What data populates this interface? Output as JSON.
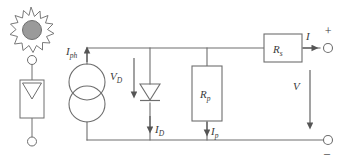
{
  "diagram": {
    "type": "electrical-schematic",
    "canvas": {
      "width": 349,
      "height": 168
    },
    "colors": {
      "wire": "#6e6e6e",
      "component_stroke": "#6e6e6e",
      "sun_fill": "#9a9a9a",
      "sun_stroke": "#6e6e6e",
      "label": "#3a3a3a",
      "background": "#ffffff"
    },
    "labels": {
      "photocurrent": "I",
      "photocurrent_sub": "ph",
      "diode_voltage": "V",
      "diode_voltage_sub": "D",
      "diode_current": "I",
      "diode_current_sub": "D",
      "shunt_resistor": "R",
      "shunt_resistor_sub": "p",
      "shunt_current": "I",
      "shunt_current_sub": "p",
      "series_resistor": "R",
      "series_resistor_sub": "s",
      "output_current": "I",
      "output_voltage": "V",
      "plus_terminal": "+",
      "minus_terminal": "–"
    },
    "components": [
      {
        "name": "sun-source",
        "kind": "illumination-symbol"
      },
      {
        "name": "photodiode-symbol",
        "kind": "pv-cell-symbol"
      },
      {
        "name": "current-source",
        "kind": "dependent-current-source",
        "label": "I_ph"
      },
      {
        "name": "diode",
        "kind": "diode",
        "label": "I_D"
      },
      {
        "name": "shunt-resistor",
        "kind": "resistor",
        "label": "R_p"
      },
      {
        "name": "series-resistor",
        "kind": "resistor",
        "label": "R_s"
      },
      {
        "name": "output-terminal-positive",
        "kind": "terminal",
        "label": "+"
      },
      {
        "name": "output-terminal-negative",
        "kind": "terminal",
        "label": "–"
      }
    ]
  }
}
